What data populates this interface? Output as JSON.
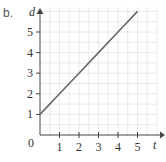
{
  "part_label": "b.",
  "chart_data": {
    "type": "line",
    "title": "",
    "xlabel": "t",
    "ylabel": "d",
    "x": [
      0,
      1,
      2,
      3,
      4,
      5
    ],
    "series": [
      {
        "name": "d",
        "values": [
          1,
          2,
          3,
          4,
          5,
          6
        ]
      }
    ],
    "x_ticks": [
      "1",
      "2",
      "3",
      "4",
      "5"
    ],
    "y_ticks": [
      "1",
      "2",
      "3",
      "4",
      "5"
    ],
    "origin_label": "0",
    "xlim": [
      0,
      6
    ],
    "ylim": [
      0,
      6.2
    ],
    "grid": true,
    "line_color": "#666666",
    "grid_color": "#e4e4e4"
  }
}
